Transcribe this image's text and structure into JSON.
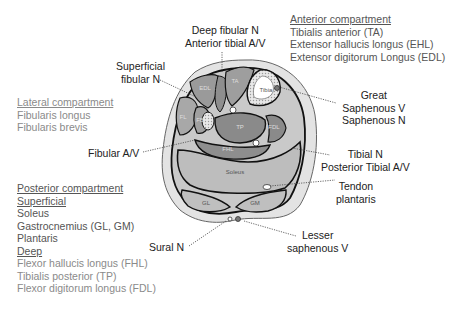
{
  "callouts": {
    "deep_fibular": [
      "Deep fibular N",
      "Anterior tibial A/V"
    ],
    "superficial_fibular": [
      "Superficial",
      "fibular N"
    ],
    "fibular_av": "Fibular A/V",
    "great_saphenous": [
      "Great",
      "Saphenous V",
      "Saphenous N"
    ],
    "tibial": [
      "Tibial N",
      "Posterior Tibial A/V"
    ],
    "tendon_plantaris": [
      "Tendon",
      "plantaris"
    ],
    "sural": "Sural N",
    "lesser_saphenous": [
      "Lesser",
      "saphenous V"
    ]
  },
  "compartments": {
    "anterior": {
      "title": "Anterior compartment",
      "items": [
        "Tibialis anterior (TA)",
        "Extensor hallucis longus (EHL)",
        "Extensor digitorum Longus (EDL)"
      ]
    },
    "lateral": {
      "title": "Lateral compartment",
      "items": [
        "Fibularis longus",
        "Fibularis brevis"
      ]
    },
    "posterior": {
      "title": "Posterior compartment",
      "superficial_title": "Superficial",
      "superficial_items": [
        "Soleus",
        "Gastrocnemius (GL, GM)",
        "Plantaris"
      ],
      "deep_title": "Deep",
      "deep_items": [
        "Flexor hallucis longus (FHL)",
        "Tibialis posterior (TP)",
        "Flexor digitorum longus (FDL)"
      ]
    }
  },
  "structure_labels": {
    "ta": "TA",
    "tibia": "Tibia",
    "edl": "EDL",
    "ehl": "EHL",
    "fl": "FL",
    "fb": "FB",
    "tp": "TP",
    "fdl": "FDL",
    "fhl": "FHL",
    "soleus": "Soleus",
    "gl": "GL",
    "gm": "GM"
  }
}
